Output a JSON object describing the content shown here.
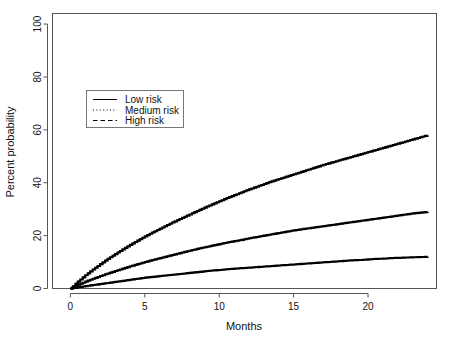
{
  "chart_data": {
    "type": "line",
    "title": "",
    "xlabel": "Months",
    "ylabel": "Percent probability",
    "xlim": [
      -1.2,
      24.6
    ],
    "ylim": [
      0,
      104
    ],
    "xticks": [
      0,
      5,
      10,
      15,
      20
    ],
    "yticks": [
      0,
      20,
      40,
      60,
      80,
      100
    ],
    "xticklabels": [
      "0",
      "5",
      "10",
      "15",
      "20"
    ],
    "yticklabels": [
      "0",
      "20",
      "40",
      "60",
      "80",
      "100"
    ],
    "grid": false,
    "legend_position": "upper left",
    "series": [
      {
        "name": "Low risk",
        "style": "solid",
        "x": [
          0,
          0.5,
          1,
          1.5,
          2,
          2.5,
          3,
          3.5,
          4,
          4.5,
          5,
          5.5,
          6,
          6.5,
          7,
          7.5,
          8,
          8.5,
          9,
          9.5,
          10,
          10.5,
          11,
          11.5,
          12,
          12.5,
          13,
          13.5,
          14,
          14.5,
          15,
          15.5,
          16,
          16.5,
          17,
          17.5,
          18,
          18.5,
          19,
          19.5,
          20,
          20.5,
          21,
          21.5,
          22,
          22.5,
          23,
          23.5,
          24
        ],
        "y": [
          0,
          0.5,
          0.9,
          1.3,
          1.7,
          2.1,
          2.5,
          2.9,
          3.3,
          3.7,
          4.1,
          4.4,
          4.7,
          5.0,
          5.3,
          5.6,
          5.9,
          6.2,
          6.5,
          6.8,
          7.0,
          7.3,
          7.5,
          7.7,
          7.9,
          8.1,
          8.3,
          8.5,
          8.7,
          8.9,
          9.1,
          9.3,
          9.5,
          9.7,
          9.9,
          10.1,
          10.3,
          10.5,
          10.7,
          10.8,
          11.0,
          11.2,
          11.3,
          11.5,
          11.6,
          11.7,
          11.8,
          11.9,
          12.0
        ]
      },
      {
        "name": "Medium risk",
        "style": "dotted",
        "x": [
          0,
          0.5,
          1,
          1.5,
          2,
          2.5,
          3,
          3.5,
          4,
          4.5,
          5,
          5.5,
          6,
          6.5,
          7,
          7.5,
          8,
          8.5,
          9,
          9.5,
          10,
          10.5,
          11,
          11.5,
          12,
          12.5,
          13,
          13.5,
          14,
          14.5,
          15,
          15.5,
          16,
          16.5,
          17,
          17.5,
          18,
          18.5,
          19,
          19.5,
          20,
          20.5,
          21,
          21.5,
          22,
          22.5,
          23,
          23.5,
          24
        ],
        "y": [
          0,
          1.4,
          2.6,
          3.7,
          4.7,
          5.7,
          6.6,
          7.5,
          8.4,
          9.2,
          10.0,
          10.8,
          11.5,
          12.2,
          12.9,
          13.6,
          14.3,
          15.0,
          15.6,
          16.2,
          16.8,
          17.4,
          17.9,
          18.4,
          19.0,
          19.5,
          20.0,
          20.5,
          21.0,
          21.5,
          22.0,
          22.4,
          22.8,
          23.2,
          23.6,
          24.0,
          24.4,
          24.8,
          25.2,
          25.6,
          26.0,
          26.4,
          26.8,
          27.2,
          27.6,
          28.0,
          28.4,
          28.7,
          29.0
        ]
      },
      {
        "name": "High risk",
        "style": "dashed",
        "x": [
          0,
          0.5,
          1,
          1.5,
          2,
          2.5,
          3,
          3.5,
          4,
          4.5,
          5,
          5.5,
          6,
          6.5,
          7,
          7.5,
          8,
          8.5,
          9,
          9.5,
          10,
          10.5,
          11,
          11.5,
          12,
          12.5,
          13,
          13.5,
          14,
          14.5,
          15,
          15.5,
          16,
          16.5,
          17,
          17.5,
          18,
          18.5,
          19,
          19.5,
          20,
          20.5,
          21,
          21.5,
          22,
          22.5,
          23,
          23.5,
          24
        ],
        "y": [
          0,
          2.6,
          5.0,
          7.2,
          9.2,
          11.2,
          13.0,
          14.8,
          16.5,
          18.1,
          19.7,
          21.2,
          22.6,
          24.0,
          25.4,
          26.7,
          28.0,
          29.3,
          30.6,
          31.8,
          33.0,
          34.2,
          35.3,
          36.4,
          37.5,
          38.5,
          39.5,
          40.5,
          41.4,
          42.3,
          43.2,
          44.1,
          45.0,
          45.9,
          46.8,
          47.6,
          48.4,
          49.2,
          50.0,
          50.8,
          51.6,
          52.4,
          53.2,
          54.0,
          54.8,
          55.6,
          56.4,
          57.2,
          58.0
        ]
      }
    ],
    "legend_entries": [
      {
        "label": "Low risk",
        "style": "solid"
      },
      {
        "label": "Medium risk",
        "style": "dotted"
      },
      {
        "label": "High risk",
        "style": "dashed"
      }
    ]
  }
}
